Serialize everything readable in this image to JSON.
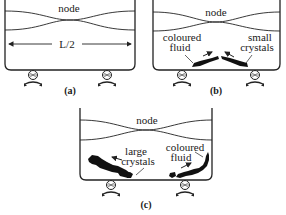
{
  "figure": {
    "panels": [
      {
        "id": "a",
        "caption": "(a)",
        "node_label": "node",
        "dimension_label": "L/2"
      },
      {
        "id": "b",
        "caption": "(b)",
        "node_label": "node",
        "labels": {
          "left_line1": "coloured",
          "left_line2": "fluid",
          "right_line1": "small",
          "right_line2": "crystals"
        }
      },
      {
        "id": "c",
        "caption": "(c)",
        "node_label": "node",
        "labels": {
          "left_line1": "large",
          "left_line2": "crystals",
          "right_line1": "coloured",
          "right_line2": "fluid"
        }
      }
    ],
    "colors": {
      "line": "#222222",
      "fill": "#111111",
      "background": "#ffffff"
    }
  }
}
